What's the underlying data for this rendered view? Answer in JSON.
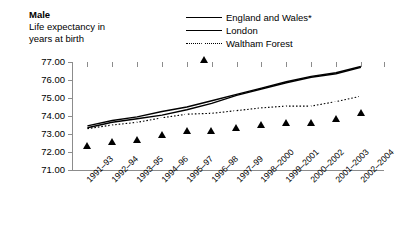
{
  "heading": {
    "line1": "Male",
    "line2": "Life expectancy in",
    "line3": "years at birth"
  },
  "legend": {
    "position": "top-right",
    "items": [
      {
        "label": "England and Wales*",
        "marker": "filled-diamond",
        "line": "solid"
      },
      {
        "label": "London",
        "marker": "filled-square",
        "line": "solid"
      },
      {
        "label": "Waltham Forest",
        "marker": "open-triangle",
        "line": "dotted"
      }
    ]
  },
  "chart_data": {
    "type": "line",
    "title": "Male",
    "subtitle": "Life expectancy in years at birth",
    "xlabel": "",
    "ylabel": "",
    "ylim": [
      71.0,
      77.0
    ],
    "yticks": [
      "71.00",
      "72.00",
      "73.00",
      "74.00",
      "75.00",
      "76.00",
      "77.00"
    ],
    "ytick_values": [
      71.0,
      72.0,
      73.0,
      74.0,
      75.0,
      76.0,
      77.0
    ],
    "grid": false,
    "legend_position": "top-right",
    "categories": [
      "1991–93",
      "1992–94",
      "1993–95",
      "1994–96",
      "1995–97",
      "1996–98",
      "1997–99",
      "1998–2000",
      "1999–2001",
      "2000–2002",
      "2001–2003",
      "2002–2004"
    ],
    "series": [
      {
        "name": "England and Wales*",
        "marker": "filled-diamond",
        "line": "solid",
        "values": [
          73.45,
          73.75,
          73.95,
          74.25,
          74.5,
          74.85,
          75.2,
          75.55,
          75.9,
          76.2,
          76.4,
          76.75
        ]
      },
      {
        "name": "London",
        "marker": "filled-square",
        "line": "solid",
        "values": [
          73.35,
          73.65,
          73.85,
          74.05,
          74.35,
          74.7,
          75.15,
          75.5,
          75.85,
          76.15,
          76.35,
          76.7
        ]
      },
      {
        "name": "Waltham Forest",
        "marker": "open-triangle",
        "line": "dotted",
        "values": [
          73.3,
          73.5,
          73.65,
          73.9,
          74.1,
          74.15,
          74.3,
          74.45,
          74.55,
          74.55,
          74.8,
          75.1
        ]
      }
    ]
  },
  "colors": {
    "series_line": "#000000",
    "axis": "#8c8c8c",
    "background": "#ffffff"
  }
}
